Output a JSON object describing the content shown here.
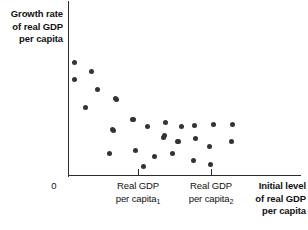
{
  "figure": {
    "title": "",
    "y_axis_label": [
      "Growth rate",
      "of real GDP",
      "per capita"
    ],
    "origin_label": "0",
    "x_axis_title": [
      "Initial level",
      "of real GDP",
      "per capita"
    ],
    "x_tick_labels": [
      {
        "line1": "Real GDP",
        "line2": "per capita",
        "sub": "1",
        "x": 138
      },
      {
        "line1": "Real GDP",
        "line2": "per capita",
        "sub": "2",
        "x": 211
      }
    ],
    "colors": {
      "axis": "#2b2b2b",
      "marker": "#333333",
      "text": "#111111",
      "background": "#ffffff"
    }
  },
  "chart_data": {
    "type": "scatter",
    "title": "",
    "xlabel": "Initial level of real GDP per capita",
    "ylabel": "Growth rate of real GDP per capita",
    "grid": false,
    "legend": null,
    "xlim": [
      68,
      301
    ],
    "ylim": [
      175,
      1
    ],
    "x_ticks": [
      138,
      211
    ],
    "x_tick_labels": [
      "Real GDP per capita₁",
      "Real GDP per capita₂"
    ],
    "origin": "0",
    "annotations": [],
    "note": "Negative (convergence) relationship: growth rate falls as initial real GDP per capita rises. Point coordinates are pixel positions within the plot box.",
    "points": [
      {
        "x": 74,
        "y": 62
      },
      {
        "x": 74,
        "y": 79
      },
      {
        "x": 91,
        "y": 71
      },
      {
        "x": 97,
        "y": 89
      },
      {
        "x": 85,
        "y": 107
      },
      {
        "x": 115,
        "y": 98
      },
      {
        "x": 116,
        "y": 99
      },
      {
        "x": 113,
        "y": 130
      },
      {
        "x": 132,
        "y": 119
      },
      {
        "x": 133,
        "y": 119
      },
      {
        "x": 112,
        "y": 129
      },
      {
        "x": 147,
        "y": 126
      },
      {
        "x": 165,
        "y": 122
      },
      {
        "x": 163,
        "y": 137
      },
      {
        "x": 177,
        "y": 141
      },
      {
        "x": 109,
        "y": 153
      },
      {
        "x": 135,
        "y": 150
      },
      {
        "x": 154,
        "y": 156
      },
      {
        "x": 143,
        "y": 166
      },
      {
        "x": 181,
        "y": 126
      },
      {
        "x": 194,
        "y": 125
      },
      {
        "x": 213,
        "y": 124
      },
      {
        "x": 164,
        "y": 135
      },
      {
        "x": 178,
        "y": 141
      },
      {
        "x": 195,
        "y": 138
      },
      {
        "x": 209,
        "y": 146
      },
      {
        "x": 172,
        "y": 153
      },
      {
        "x": 193,
        "y": 160
      },
      {
        "x": 210,
        "y": 164
      },
      {
        "x": 232,
        "y": 124
      },
      {
        "x": 231,
        "y": 141
      }
    ]
  }
}
